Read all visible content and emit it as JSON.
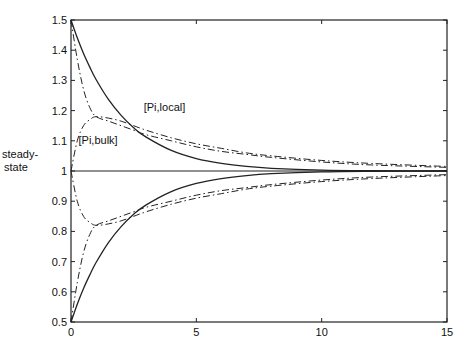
{
  "chart_data": {
    "type": "line",
    "title": "",
    "xlabel": "",
    "ylabel": "steady-state",
    "xlim": [
      0,
      15
    ],
    "ylim": [
      0.5,
      1.5
    ],
    "grid": false,
    "legend": "none",
    "x_ticks": [
      "0",
      "5",
      "10",
      "15"
    ],
    "y_ticks": [
      "0.5",
      "0.6",
      "0.7",
      "0.8",
      "0.9",
      "1",
      "1.1",
      "1.2",
      "1.3",
      "1.4",
      "1.5"
    ],
    "y_label_lines": [
      "steady-",
      "state"
    ],
    "annotations": [
      {
        "text": "[Pi,local]",
        "x": 2.9,
        "y": 1.2
      },
      {
        "text": "[Pi,bulk]",
        "x": 0.3,
        "y": 1.09
      }
    ],
    "reference_line": {
      "name": "steady-state",
      "y": 1.0
    },
    "x": [
      0,
      0.25,
      0.5,
      0.75,
      1,
      1.5,
      2,
      2.5,
      3,
      4,
      5,
      6,
      7,
      8,
      10,
      12,
      15
    ],
    "series": [
      {
        "name": "[Pi,local] upper",
        "style": "solid",
        "values": [
          1.5,
          1.441,
          1.389,
          1.344,
          1.303,
          1.236,
          1.184,
          1.143,
          1.112,
          1.068,
          1.041,
          1.025,
          1.015,
          1.009,
          1.003,
          1.001,
          1.0
        ]
      },
      {
        "name": "[Pi,local] lower",
        "style": "solid",
        "values": [
          0.5,
          0.559,
          0.611,
          0.656,
          0.697,
          0.764,
          0.816,
          0.857,
          0.888,
          0.932,
          0.959,
          0.975,
          0.985,
          0.991,
          0.997,
          0.999,
          1.0
        ]
      },
      {
        "name": "[Pi,bulk] upper (from 1.5)",
        "style": "dashdot",
        "values": [
          1.5,
          1.37,
          1.27,
          1.21,
          1.18,
          1.165,
          1.15,
          1.135,
          1.12,
          1.1,
          1.08,
          1.065,
          1.055,
          1.045,
          1.03,
          1.02,
          1.012
        ]
      },
      {
        "name": "[Pi,bulk] upper (from 1.0)",
        "style": "dashdot",
        "values": [
          1.0,
          1.1,
          1.15,
          1.17,
          1.18,
          1.175,
          1.165,
          1.15,
          1.135,
          1.11,
          1.09,
          1.075,
          1.06,
          1.05,
          1.035,
          1.025,
          1.015
        ]
      },
      {
        "name": "[Pi,bulk] lower (from 0.5)",
        "style": "dashdot",
        "values": [
          0.5,
          0.63,
          0.73,
          0.79,
          0.82,
          0.835,
          0.85,
          0.865,
          0.88,
          0.9,
          0.92,
          0.935,
          0.945,
          0.955,
          0.97,
          0.98,
          0.988
        ]
      },
      {
        "name": "[Pi,bulk] lower (from 1.0)",
        "style": "dashdot",
        "values": [
          1.0,
          0.9,
          0.85,
          0.83,
          0.82,
          0.825,
          0.835,
          0.85,
          0.865,
          0.89,
          0.91,
          0.925,
          0.94,
          0.95,
          0.965,
          0.975,
          0.985
        ]
      }
    ]
  }
}
